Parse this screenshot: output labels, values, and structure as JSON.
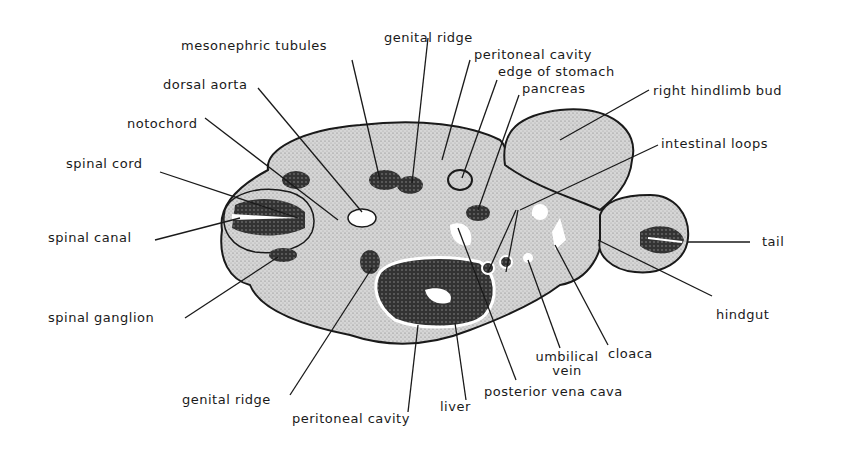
{
  "figure": {
    "type": "labeled anatomical cross-section drawing",
    "labels": {
      "mesonephric_tubules": "mesonephric tubules",
      "genital_ridge_top": "genital ridge",
      "peritoneal_cavity_top": "peritoneal cavity",
      "edge_of_stomach": "edge of stomach",
      "pancreas": "pancreas",
      "right_hindlimb_bud": "right hindlimb bud",
      "dorsal_aorta": "dorsal aorta",
      "notochord": "notochord",
      "intestinal_loops": "intestinal loops",
      "spinal_cord": "spinal cord",
      "spinal_canal": "spinal canal",
      "tail": "tail",
      "spinal_ganglion": "spinal ganglion",
      "hindgut": "hindgut",
      "umbilical_vein_line1": "umbilical",
      "umbilical_vein_line2": "vein",
      "cloaca": "cloaca",
      "genital_ridge_bottom": "genital ridge",
      "peritoneal_cavity_bottom": "peritoneal cavity",
      "liver": "liver",
      "posterior_vena_cava": "posterior vena cava"
    },
    "colors": {
      "ink": "#1a1a1a",
      "tissue": "#cfcfcf",
      "dense": "#3a3a3a",
      "background": "#ffffff"
    }
  }
}
